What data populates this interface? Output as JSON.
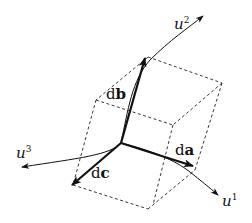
{
  "diagram": {
    "type": "curvilinear-coordinate-volume-element",
    "labels": {
      "u1": {
        "base": "u",
        "sup": "1"
      },
      "u2": {
        "base": "u",
        "sup": "2"
      },
      "u3": {
        "base": "u",
        "sup": "3"
      },
      "da": {
        "d": "d",
        "vec": "a"
      },
      "db": {
        "d": "d",
        "vec": "b"
      },
      "dc": {
        "d": "d",
        "vec": "c"
      }
    },
    "colors": {
      "ink": "#111111",
      "background": "#ffffff"
    }
  }
}
